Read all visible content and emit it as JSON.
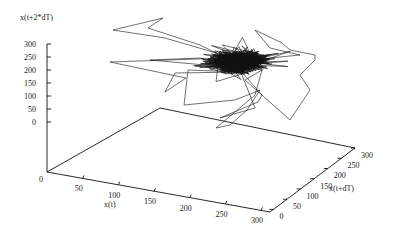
{
  "chart_data": {
    "type": "line",
    "subtype": "3d-phase-space-trajectory",
    "title": "",
    "xlabel": "x(t)",
    "ylabel": "x(t+dT)",
    "zlabel": "x(t+2*dT)",
    "xlim": [
      0,
      300
    ],
    "ylim": [
      0,
      300
    ],
    "zlim": [
      0,
      300
    ],
    "x_ticks": [
      "0",
      "50",
      "100",
      "150",
      "200",
      "250",
      "300"
    ],
    "y_ticks": [
      "0",
      "50",
      "100",
      "150",
      "200",
      "250",
      "300"
    ],
    "z_ticks": [
      "0",
      "50",
      "100",
      "150",
      "200",
      "250",
      "300"
    ],
    "grid": false,
    "legend": "none",
    "cluster_center_approx": {
      "x": 230,
      "y": 230,
      "z": 230
    },
    "line_color": "#111111"
  }
}
